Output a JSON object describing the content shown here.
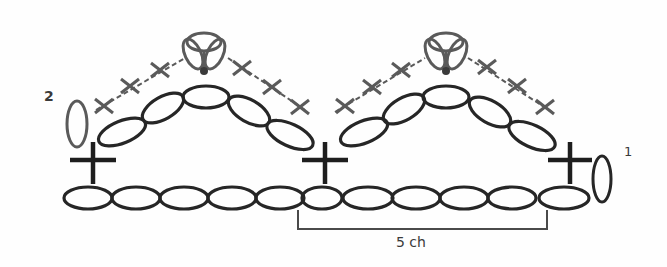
{
  "diagram": {
    "type": "crochet-chart",
    "labels": {
      "row1": "1",
      "row2": "2",
      "repeat_bracket": "5 ch"
    },
    "colors": {
      "dark_stroke": "#262626",
      "grey_stroke": "#5a5a5a",
      "background": "#ffffff"
    },
    "rows": [
      {
        "row": 1,
        "label": "1",
        "stitches": [
          "turning-ch",
          "foundation-chain x11",
          "sc x3"
        ]
      },
      {
        "row": 2,
        "label": "2",
        "stitches": [
          "turning-ch",
          "ch-arch x5 (x2)",
          "sc x6 per arch",
          "cluster picot x2"
        ]
      }
    ],
    "bracket": {
      "text": "5 ch",
      "spans_chains": 5
    }
  }
}
